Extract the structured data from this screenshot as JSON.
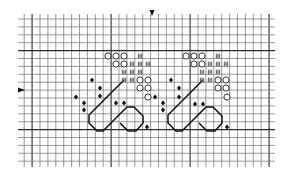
{
  "grid": {
    "x0": 18,
    "y0": 19,
    "x1": 275,
    "y1": 164,
    "cell": 7.9,
    "origin_x": 24.2,
    "cols": 32,
    "rows": 19,
    "line_color": "#6e6e6e",
    "major_color": "#2a2a2a",
    "major_every": 10,
    "major_col_offset": 1,
    "major_row_offset": 4
  },
  "markers": {
    "top_center": {
      "x": 152,
      "y": 14,
      "icon": "arrow-down-icon"
    },
    "left_center": {
      "x": 20,
      "y": 90,
      "icon": "arrow-right-icon"
    }
  },
  "legend": {
    "circle": "open-circle-symbol",
    "hash": "hash-symbol",
    "diamond": "filled-diamond-symbol",
    "outline": "backstitch-line"
  },
  "motifs": [
    {
      "name": "left-motif",
      "circles": [
        [
          108,
          56
        ],
        [
          116,
          56
        ],
        [
          124,
          56
        ],
        [
          116,
          64
        ],
        [
          124,
          64
        ],
        [
          140,
          80
        ],
        [
          148,
          80
        ],
        [
          140,
          88
        ],
        [
          148,
          88
        ],
        [
          148,
          97
        ]
      ],
      "hashes": [
        [
          140,
          56
        ],
        [
          132,
          64
        ],
        [
          140,
          64
        ],
        [
          148,
          64
        ],
        [
          124,
          72
        ],
        [
          132,
          72
        ],
        [
          140,
          72
        ],
        [
          124,
          80
        ],
        [
          132,
          80
        ]
      ],
      "diamonds": [
        [
          92,
          80
        ],
        [
          100,
          88
        ],
        [
          100,
          96
        ],
        [
          76,
          97
        ],
        [
          84,
          103
        ],
        [
          84,
          110
        ],
        [
          116,
          103
        ],
        [
          124,
          103
        ],
        [
          155,
          97
        ],
        [
          147,
          127
        ]
      ],
      "outline": [
        [
          124,
          80
        ],
        [
          89,
          115
        ],
        [
          89,
          123
        ],
        [
          97,
          131
        ],
        [
          103,
          131
        ],
        [
          127,
          107
        ],
        [
          134,
          107
        ],
        [
          143,
          116
        ],
        [
          143,
          123
        ],
        [
          136,
          131
        ],
        [
          128,
          131
        ],
        [
          120,
          123
        ]
      ]
    },
    {
      "name": "right-motif",
      "circles": [
        [
          186,
          56
        ],
        [
          194,
          56
        ],
        [
          202,
          56
        ],
        [
          194,
          64
        ],
        [
          202,
          64
        ],
        [
          218,
          80
        ],
        [
          226,
          80
        ],
        [
          218,
          88
        ],
        [
          226,
          88
        ],
        [
          227,
          97
        ]
      ],
      "hashes": [
        [
          218,
          56
        ],
        [
          210,
          64
        ],
        [
          218,
          64
        ],
        [
          226,
          64
        ],
        [
          202,
          72
        ],
        [
          210,
          72
        ],
        [
          218,
          72
        ],
        [
          202,
          80
        ],
        [
          210,
          80
        ]
      ],
      "diamonds": [
        [
          171,
          80
        ],
        [
          179,
          88
        ],
        [
          179,
          97
        ],
        [
          163,
          103
        ],
        [
          163,
          110
        ],
        [
          195,
          104
        ],
        [
          203,
          104
        ],
        [
          227,
          127
        ]
      ],
      "outline": [
        [
          203,
          80
        ],
        [
          168,
          115
        ],
        [
          168,
          123
        ],
        [
          176,
          131
        ],
        [
          182,
          131
        ],
        [
          206,
          107
        ],
        [
          213,
          107
        ],
        [
          222,
          116
        ],
        [
          222,
          123
        ],
        [
          215,
          131
        ],
        [
          207,
          131
        ],
        [
          199,
          123
        ]
      ]
    }
  ]
}
